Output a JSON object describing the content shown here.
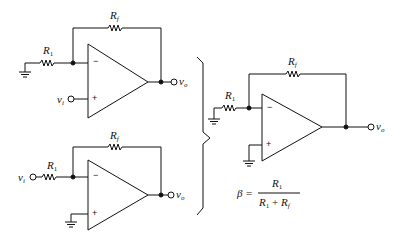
{
  "diagram": {
    "type": "op-amp circuits",
    "circuits": [
      {
        "id": "noninverting",
        "labels": {
          "rf": "R",
          "rf_sub": "f",
          "r1": "R",
          "r1_sub": "1",
          "vi": "v",
          "vi_sub": "i",
          "vo": "v",
          "vo_sub": "o",
          "minus": "−",
          "plus": "+"
        }
      },
      {
        "id": "inverting",
        "labels": {
          "rf": "R",
          "rf_sub": "f",
          "r1": "R",
          "r1_sub": "1",
          "vi": "v",
          "vi_sub": "i",
          "vo": "v",
          "vo_sub": "o",
          "minus": "−",
          "plus": "+"
        }
      },
      {
        "id": "feedback-equivalent",
        "labels": {
          "rf": "R",
          "rf_sub": "f",
          "r1": "R",
          "r1_sub": "1",
          "vo": "v",
          "vo_sub": "o",
          "minus": "−",
          "plus": "+"
        }
      }
    ],
    "formula": {
      "lhs": "β =",
      "numerator": "R",
      "numerator_sub": "1",
      "denominator_a": "R",
      "denominator_a_sub": "1",
      "plus": "+",
      "denominator_b": "R",
      "denominator_b_sub": "f"
    },
    "line_color": "#111111"
  }
}
